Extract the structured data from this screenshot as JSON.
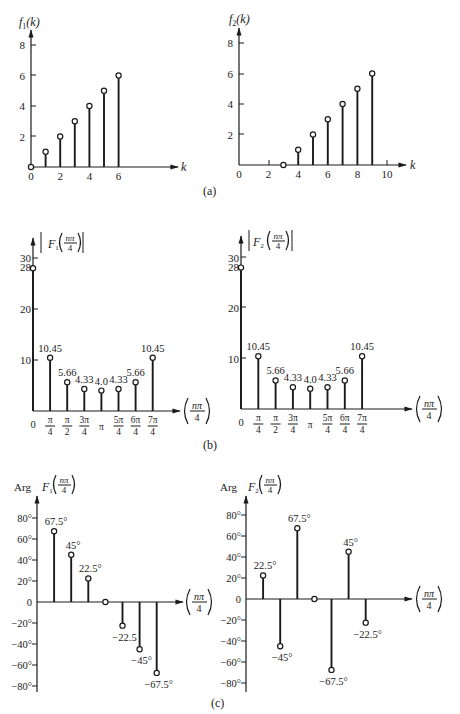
{
  "figure": {
    "panel_labels": [
      "(a)",
      "(b)",
      "(c)"
    ]
  },
  "chart_data": [
    {
      "id": "f1",
      "type": "stem",
      "title": "f1(k)",
      "ylabel": "f1(k)",
      "xlabel": "k",
      "x": [
        0,
        1,
        2,
        3,
        4,
        5,
        6
      ],
      "values": [
        0,
        1,
        2,
        3,
        4,
        5,
        6
      ],
      "xticks": [
        "0",
        "2",
        "4",
        "6"
      ],
      "yticks": [
        "2",
        "4",
        "6",
        "8"
      ],
      "ylim": [
        0,
        8
      ],
      "grid": false
    },
    {
      "id": "f2",
      "type": "stem",
      "title": "f2(k)",
      "ylabel": "f2(k)",
      "xlabel": "k",
      "x": [
        3,
        4,
        5,
        6,
        7,
        8,
        9
      ],
      "values": [
        0,
        1,
        2,
        3,
        4,
        5,
        6
      ],
      "xticks": [
        "0",
        "2",
        "4",
        "6",
        "8",
        "10"
      ],
      "yticks": [
        "2",
        "4",
        "6",
        "8"
      ],
      "ylim": [
        0,
        8
      ],
      "grid": false
    },
    {
      "id": "F1mag",
      "type": "stem",
      "title": "|F1(nπ/4)|",
      "ylabel": "|F1(nπ/4)|",
      "xlabel": "(nπ/4)",
      "categories": [
        "0",
        "π/4",
        "π/2",
        "3π/4",
        "π",
        "5π/4",
        "6π/4",
        "7π/4"
      ],
      "values": [
        28,
        10.45,
        5.66,
        4.33,
        4.0,
        4.33,
        5.66,
        10.45
      ],
      "data_labels": [
        "",
        "10.45",
        "5.66",
        "4.33",
        "4.0",
        "4.33",
        "5.66",
        "10.45"
      ],
      "yticks": [
        "10",
        "20",
        "30",
        "28"
      ],
      "ylim": [
        0,
        30
      ],
      "grid": false
    },
    {
      "id": "F2mag",
      "type": "stem",
      "title": "|F2(nπ/4)|",
      "ylabel": "|F2(nπ/4)|",
      "xlabel": "(nπ/4)",
      "categories": [
        "0",
        "π/4",
        "π/2",
        "3π/4",
        "π",
        "5π/4",
        "6π/4",
        "7π/4"
      ],
      "values": [
        28,
        10.45,
        5.66,
        4.33,
        4.0,
        4.33,
        5.66,
        10.45
      ],
      "data_labels": [
        "",
        "10.45",
        "5.66",
        "4.33",
        "4.0",
        "4.33",
        "5.66",
        "10.45"
      ],
      "yticks": [
        "10",
        "20",
        "30",
        "28"
      ],
      "ylim": [
        0,
        30
      ],
      "grid": false
    },
    {
      "id": "F1arg",
      "type": "stem",
      "title": "Arg F1(nπ/4)",
      "ylabel": "Arg F1(nπ/4)",
      "xlabel": "(nπ/4)",
      "x": [
        1,
        2,
        3,
        4,
        5,
        6,
        7
      ],
      "values": [
        67.5,
        45,
        22.5,
        0,
        -22.5,
        -45,
        -67.5
      ],
      "data_labels": [
        "67.5°",
        "45°",
        "22.5°",
        "",
        "−22.5",
        "−45°",
        "−67.5°"
      ],
      "yticks": [
        "80°",
        "60°",
        "40°",
        "20°",
        "0",
        "−20°",
        "−40°",
        "−60°",
        "−80°"
      ],
      "ylim": [
        -80,
        80
      ],
      "grid": false
    },
    {
      "id": "F2arg",
      "type": "stem",
      "title": "Arg F2(nπ/4)",
      "ylabel": "Arg F2(nπ/4)",
      "xlabel": "(nπ/4)",
      "x": [
        1,
        2,
        3,
        4,
        5,
        6,
        7
      ],
      "values": [
        22.5,
        -45,
        67.5,
        0,
        -67.5,
        45,
        -22.5
      ],
      "data_labels": [
        "22.5°",
        "−45°",
        "67.5°",
        "",
        "−67.5°",
        "45°",
        "−22.5°"
      ],
      "yticks": [
        "80°",
        "60°",
        "40°",
        "20°",
        "0",
        "−20°",
        "−40°",
        "−60°",
        "−80°"
      ],
      "ylim": [
        -80,
        80
      ],
      "grid": false
    }
  ],
  "labels": {
    "f1_ylabel_main": "f",
    "f1_ylabel_sub": "1",
    "f1_ylabel_arg": "(k)",
    "f2_ylabel_main": "f",
    "f2_ylabel_sub": "2",
    "f2_ylabel_arg": "(k)",
    "k": "k",
    "F": "F",
    "sub1": "1",
    "sub2": "2",
    "npi": "nπ",
    "four": "4",
    "arg": "Arg",
    "zero": "0",
    "pi": "π"
  }
}
